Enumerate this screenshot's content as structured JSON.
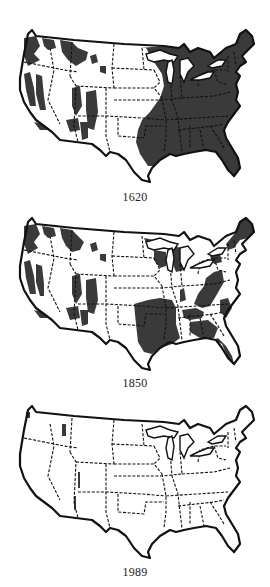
{
  "figure": {
    "forest_color": "#3a3a3a",
    "background_color": "#ffffff",
    "outline_color": "#111111"
  },
  "maps": [
    {
      "year": "1620",
      "forest_extent": "nearly entire eastern half plus western mountain patches"
    },
    {
      "year": "1850",
      "forest_extent": "eastern forest fragmented, cleared corridors; western patches remain"
    },
    {
      "year": "1989",
      "forest_extent": "virgin forest nearly gone; small slivers in west"
    }
  ]
}
